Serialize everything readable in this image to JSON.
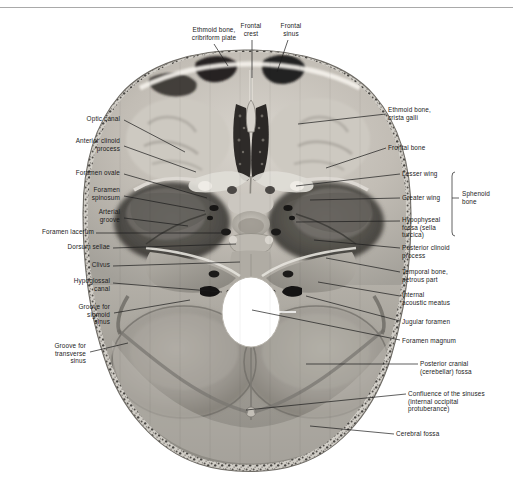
{
  "figure": {
    "caption": "Figure: the internal base of the skull, superior view.",
    "image_type": "grayscale anatomical photograph",
    "colors": {
      "background": "#ffffff",
      "bone_light": "#cfcbc4",
      "bone_mid": "#9d9a93",
      "bone_dark": "#6d6a64",
      "cavity_dark": "#2b2a28",
      "foramen_magnum": "#ffffff",
      "leader_line": "#1b1b1b",
      "text": "#1b1b1b",
      "top_rule": "#9a9a9a"
    }
  },
  "labels_top": [
    {
      "id": "ethmoid-cribriform",
      "text": "Ethmoid bone,\ncribriform plate",
      "align": "center",
      "x": 178,
      "y": 26,
      "w": 72,
      "leader": [
        [
          214,
          44
        ],
        [
          228,
          66
        ]
      ]
    },
    {
      "id": "frontal-crest",
      "text": "Frontal\ncrest",
      "align": "center",
      "x": 232,
      "y": 22,
      "w": 38,
      "leader": [
        [
          252,
          40
        ],
        [
          252,
          78
        ]
      ]
    },
    {
      "id": "frontal-sinus",
      "text": "Frontal\nsinus",
      "align": "center",
      "x": 272,
      "y": 22,
      "w": 38,
      "leader": [
        [
          288,
          40
        ],
        [
          277,
          72
        ]
      ]
    }
  ],
  "labels_left": [
    {
      "id": "optic-canal",
      "text": "Optic canal",
      "x": 62,
      "y": 115,
      "w": 58,
      "leader": [
        [
          124,
          120
        ],
        [
          185,
          152
        ]
      ]
    },
    {
      "id": "anterior-clinoid-process",
      "text": "Anterior clinoid\nprocess",
      "x": 48,
      "y": 137,
      "w": 72,
      "leader": [
        [
          124,
          146
        ],
        [
          196,
          172
        ]
      ]
    },
    {
      "id": "foramen-ovale",
      "text": "Foramen ovale",
      "x": 50,
      "y": 169,
      "w": 70,
      "leader": [
        [
          124,
          174
        ],
        [
          207,
          198
        ]
      ]
    },
    {
      "id": "foramen-spinosum",
      "text": "Foramen\nspinosum",
      "x": 58,
      "y": 186,
      "w": 62,
      "leader": [
        [
          124,
          196
        ],
        [
          205,
          211
        ]
      ]
    },
    {
      "id": "arterial-groove",
      "text": "Arterial\ngroove",
      "x": 62,
      "y": 208,
      "w": 58,
      "leader": [
        [
          124,
          218
        ],
        [
          188,
          226
        ]
      ]
    },
    {
      "id": "foramen-lacerum",
      "text": "Foramen lacerum",
      "x": 16,
      "y": 228,
      "w": 78,
      "leader": [
        [
          96,
          233
        ],
        [
          222,
          233
        ]
      ]
    },
    {
      "id": "dorsum-sellae",
      "text": "Dorsum sellae",
      "x": 40,
      "y": 243,
      "w": 70,
      "leader": [
        [
          113,
          248
        ],
        [
          236,
          244
        ]
      ]
    },
    {
      "id": "clivus",
      "text": "Clivus",
      "x": 62,
      "y": 261,
      "w": 48,
      "leader": [
        [
          113,
          266
        ],
        [
          240,
          262
        ]
      ]
    },
    {
      "id": "hypoglossal-canal",
      "text": "Hypoglossal\ncanal",
      "x": 44,
      "y": 277,
      "w": 66,
      "leader": [
        [
          113,
          283
        ],
        [
          222,
          292
        ]
      ]
    },
    {
      "id": "groove-sigmoid-sinus",
      "text": "Groove for\nsigmoid\nsinus",
      "x": 48,
      "y": 303,
      "w": 62,
      "leader": [
        [
          114,
          313
        ],
        [
          190,
          300
        ]
      ]
    },
    {
      "id": "groove-transverse-sinus",
      "text": "Groove for\ntransverse\nsinus",
      "x": 20,
      "y": 342,
      "w": 66,
      "leader": [
        [
          90,
          352
        ],
        [
          128,
          343
        ]
      ]
    }
  ],
  "labels_right": [
    {
      "id": "ethmoid-crista-galli",
      "text": "Ethmoid bone,\ncrista galli",
      "x": 388,
      "y": 106,
      "w": 90,
      "leader": [
        [
          298,
          124
        ],
        [
          386,
          114
        ]
      ]
    },
    {
      "id": "frontal-bone",
      "text": "Frontal bone",
      "x": 388,
      "y": 144,
      "w": 70,
      "leader": [
        [
          326,
          168
        ],
        [
          386,
          148
        ]
      ]
    },
    {
      "id": "lesser-wing",
      "text": "Lesser wing",
      "x": 402,
      "y": 170,
      "w": 68,
      "leader": [
        [
          296,
          186
        ],
        [
          400,
          174
        ]
      ]
    },
    {
      "id": "greater-wing",
      "text": "Greater wing",
      "x": 402,
      "y": 194,
      "w": 70,
      "leader": [
        [
          310,
          200
        ],
        [
          400,
          198
        ]
      ]
    },
    {
      "id": "hypophyseal-fossa",
      "text": "Hypophyseal\nfossa (sella\nturcica)",
      "x": 402,
      "y": 216,
      "w": 72,
      "leader": [
        [
          296,
          222
        ],
        [
          400,
          221
        ]
      ]
    },
    {
      "id": "posterior-clinoid-process",
      "text": "Posterior clinoid\nprocess",
      "x": 402,
      "y": 244,
      "w": 84,
      "leader": [
        [
          314,
          240
        ],
        [
          400,
          248
        ]
      ]
    },
    {
      "id": "temporal-bone-petrous",
      "text": "Temporal bone,\npetrous part",
      "x": 402,
      "y": 268,
      "w": 84,
      "leader": [
        [
          326,
          258
        ],
        [
          400,
          272
        ]
      ]
    },
    {
      "id": "internal-acoustic-meatus",
      "text": "Internal\nacoustic meatus",
      "x": 402,
      "y": 291,
      "w": 84,
      "leader": [
        [
          318,
          282
        ],
        [
          400,
          296
        ]
      ]
    },
    {
      "id": "jugular-foramen",
      "text": "Jugular foramen",
      "x": 402,
      "y": 318,
      "w": 84,
      "leader": [
        [
          306,
          296
        ],
        [
          400,
          321
        ]
      ]
    },
    {
      "id": "foramen-magnum",
      "text": "Foramen magnum",
      "x": 402,
      "y": 337,
      "w": 90,
      "leader": [
        [
          252,
          310
        ],
        [
          400,
          340
        ]
      ]
    },
    {
      "id": "posterior-cranial-fossa",
      "text": "Posterior cranial\n(cerebellar) fossa",
      "x": 420,
      "y": 360,
      "w": 88,
      "leader": [
        [
          306,
          364
        ],
        [
          418,
          364
        ]
      ]
    },
    {
      "id": "confluence-of-sinuses",
      "text": "Confluence of the sinuses\n(internal occipital\nprotuberance)",
      "x": 408,
      "y": 390,
      "w": 104,
      "leader": [
        [
          246,
          410
        ],
        [
          406,
          394
        ]
      ]
    },
    {
      "id": "cerebral-fossa",
      "text": "Cerebral fossa",
      "x": 396,
      "y": 430,
      "w": 76,
      "leader": [
        [
          310,
          426
        ],
        [
          394,
          434
        ]
      ]
    }
  ],
  "bracket": {
    "id": "sphenoid-bone",
    "text": "Sphenoid\nbone",
    "x": 462,
    "y": 190,
    "w": 44,
    "line_x": 452,
    "line_top": 172,
    "line_bottom": 236,
    "tick_y": 198,
    "tick_x2": 459
  }
}
